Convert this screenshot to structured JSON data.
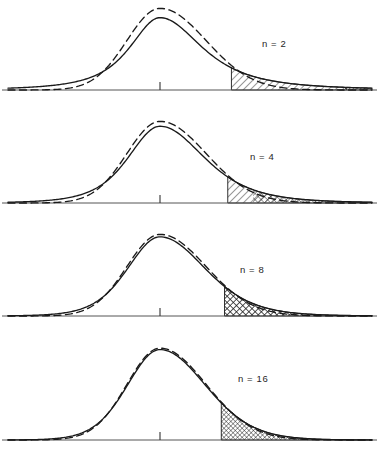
{
  "figure": {
    "panel_count": 4,
    "curve_styles": {
      "t_distribution": "solid",
      "normal_distribution": "dashed"
    },
    "stroke_color": "#1a1a1a",
    "background_color": "#ffffff"
  },
  "chart_data": {
    "type": "line",
    "title": "",
    "xlabel": "",
    "ylabel": "",
    "xlim": [
      -4.6,
      4.6
    ],
    "ylim": [
      0,
      0.43
    ],
    "grid": false,
    "legend": "none",
    "panels": [
      {
        "label": "n = 2",
        "df": 2,
        "tail_start_x": 1.55,
        "second_band_start_x": 4.05,
        "hatch": "diagonal",
        "second_band_hatch": "diagonal-dense",
        "t_peak_height": 0.3535,
        "normal_peak_height": 0.3989,
        "series": [
          {
            "name": "t (n = 2)",
            "style": "solid",
            "x": [
              -4.6,
              -4.0,
              -3.4,
              -2.8,
              -2.2,
              -1.8,
              -1.4,
              -1.0,
              -0.6,
              -0.2,
              0.0,
              0.2,
              0.6,
              1.0,
              1.4,
              1.8,
              2.2,
              2.8,
              3.4,
              4.0,
              4.6
            ],
            "y": [
              0.0078,
              0.011,
              0.0161,
              0.0247,
              0.0403,
              0.057,
              0.0808,
              0.1149,
              0.1598,
              0.2003,
              0.2067,
              0.2003,
              0.1598,
              0.1149,
              0.0808,
              0.057,
              0.0403,
              0.0247,
              0.0161,
              0.011,
              0.0078
            ]
          },
          {
            "name": "normal",
            "style": "dashed",
            "x": [
              -4.6,
              -4.0,
              -3.4,
              -2.8,
              -2.2,
              -1.8,
              -1.4,
              -1.0,
              -0.6,
              -0.2,
              0.0,
              0.2,
              0.6,
              1.0,
              1.4,
              1.8,
              2.2,
              2.8,
              3.4,
              4.0,
              4.6
            ],
            "y": [
              1e-05,
              0.0001,
              0.0012,
              0.0079,
              0.0355,
              0.079,
              0.1497,
              0.242,
              0.3332,
              0.391,
              0.3989,
              0.391,
              0.3332,
              0.242,
              0.1497,
              0.079,
              0.0355,
              0.0079,
              0.0012,
              0.0001,
              1e-05
            ]
          }
        ]
      },
      {
        "label": "n = 4",
        "df": 4,
        "tail_start_x": 1.47,
        "hatch": "diagonal-then-cross",
        "t_peak_height": 0.375,
        "normal_peak_height": 0.3989,
        "series": [
          {
            "name": "t (n = 4)",
            "style": "solid",
            "x": [
              -4.6,
              -4.0,
              -3.4,
              -2.8,
              -2.2,
              -1.8,
              -1.4,
              -1.0,
              -0.6,
              -0.2,
              0.0,
              0.2,
              0.6,
              1.0,
              1.4,
              1.8,
              2.2,
              2.8,
              3.4,
              4.0,
              4.6
            ],
            "y": [
              0.0027,
              0.0051,
              0.0099,
              0.0199,
              0.0413,
              0.0658,
              0.1037,
              0.1554,
              0.2182,
              0.267,
              0.27,
              0.267,
              0.2182,
              0.1554,
              0.1037,
              0.0658,
              0.0413,
              0.0199,
              0.0099,
              0.0051,
              0.0027
            ]
          },
          {
            "name": "normal",
            "style": "dashed",
            "x": [
              -4.6,
              -4.0,
              -3.4,
              -2.8,
              -2.2,
              -1.8,
              -1.4,
              -1.0,
              -0.6,
              -0.2,
              0.0,
              0.2,
              0.6,
              1.0,
              1.4,
              1.8,
              2.2,
              2.8,
              3.4,
              4.0,
              4.6
            ],
            "y": [
              1e-05,
              0.0001,
              0.0012,
              0.0079,
              0.0355,
              0.079,
              0.1497,
              0.242,
              0.3332,
              0.391,
              0.3989,
              0.391,
              0.3332,
              0.242,
              0.1497,
              0.079,
              0.0355,
              0.0079,
              0.0012,
              0.0001,
              1e-05
            ]
          }
        ]
      },
      {
        "label": "n = 8",
        "df": 8,
        "tail_start_x": 1.4,
        "hatch": "cross-then-diagonal",
        "t_peak_height": 0.3866,
        "normal_peak_height": 0.3989,
        "series": [
          {
            "name": "t (n = 8)",
            "style": "solid",
            "x": [
              -4.6,
              -4.0,
              -3.4,
              -2.8,
              -2.2,
              -1.8,
              -1.4,
              -1.0,
              -0.6,
              -0.2,
              0.0,
              0.2,
              0.6,
              1.0,
              1.4,
              1.8,
              2.2,
              2.8,
              3.4,
              4.0,
              4.6
            ],
            "y": [
              0.0007,
              0.0016,
              0.004,
              0.0104,
              0.028,
              0.052,
              0.0941,
              0.165,
              0.2572,
              0.3322,
              0.3866,
              0.3322,
              0.2572,
              0.165,
              0.0941,
              0.052,
              0.028,
              0.0104,
              0.004,
              0.0016,
              0.0007
            ]
          },
          {
            "name": "normal",
            "style": "dashed",
            "x": [
              -4.6,
              -4.0,
              -3.4,
              -2.8,
              -2.2,
              -1.8,
              -1.4,
              -1.0,
              -0.6,
              -0.2,
              0.0,
              0.2,
              0.6,
              1.0,
              1.4,
              1.8,
              2.2,
              2.8,
              3.4,
              4.0,
              4.6
            ],
            "y": [
              1e-05,
              0.0001,
              0.0012,
              0.0079,
              0.0355,
              0.079,
              0.1497,
              0.242,
              0.3332,
              0.391,
              0.3989,
              0.391,
              0.3332,
              0.242,
              0.1497,
              0.079,
              0.0355,
              0.0079,
              0.0012,
              0.0001,
              1e-05
            ]
          }
        ]
      },
      {
        "label": "n = 16",
        "df": 16,
        "tail_start_x": 1.33,
        "hatch": "cross",
        "t_peak_height": 0.3928,
        "normal_peak_height": 0.3989,
        "series": [
          {
            "name": "t (n = 16)",
            "style": "solid",
            "x": [
              -4.6,
              -4.0,
              -3.4,
              -2.8,
              -2.2,
              -1.8,
              -1.4,
              -1.0,
              -0.6,
              -0.2,
              0.0,
              0.2,
              0.6,
              1.0,
              1.4,
              1.8,
              2.2,
              2.8,
              3.4,
              4.0,
              4.6
            ],
            "y": [
              0.0002,
              0.0005,
              0.0019,
              0.0077,
              0.029,
              0.062,
              0.123,
              0.211,
              0.305,
              0.369,
              0.3928,
              0.369,
              0.305,
              0.211,
              0.123,
              0.062,
              0.029,
              0.0077,
              0.0019,
              0.0005,
              0.0002
            ]
          },
          {
            "name": "normal",
            "style": "dashed",
            "x": [
              -4.6,
              -4.0,
              -3.4,
              -2.8,
              -2.2,
              -1.8,
              -1.4,
              -1.0,
              -0.6,
              -0.2,
              0.0,
              0.2,
              0.6,
              1.0,
              1.4,
              1.8,
              2.2,
              2.8,
              3.4,
              4.0,
              4.6
            ],
            "y": [
              1e-05,
              0.0001,
              0.0012,
              0.0079,
              0.0355,
              0.079,
              0.1497,
              0.242,
              0.3332,
              0.391,
              0.3989,
              0.391,
              0.3332,
              0.242,
              0.1497,
              0.079,
              0.0355,
              0.0079,
              0.0012,
              0.0001,
              1e-05
            ]
          }
        ]
      }
    ]
  },
  "labels": {
    "panel_1": "n = 2",
    "panel_2": "n = 4",
    "panel_3": "n = 8",
    "panel_4": "n = 16"
  }
}
